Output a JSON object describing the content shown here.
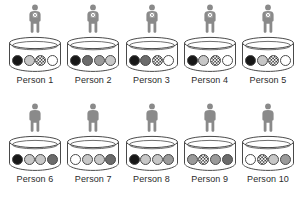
{
  "figure": {
    "title": "",
    "icon_name": "person-icon",
    "container_name": "urn-cylinder",
    "colors": {
      "black": "#171717",
      "dark_gray": "#6b6b6b",
      "gray": "#9a9a9a",
      "light_gray": "#c7c7c7",
      "white": "#ffffff",
      "checkered": "#3a3a3a",
      "outline": "#4a4a4a",
      "person_fill": "#8a8a8a",
      "label_text": "#2b2b2b",
      "background": "#ffffff"
    },
    "rows": [
      {
        "row_name": "top-row",
        "person_marked": true,
        "cells": [
          {
            "label": "Person 1",
            "balls": [
              "black",
              "light_gray",
              "checkered",
              "white"
            ]
          },
          {
            "label": "Person 2",
            "balls": [
              "black",
              "dark_gray",
              "gray",
              "light_gray"
            ]
          },
          {
            "label": "Person 3",
            "balls": [
              "black",
              "dark_gray",
              "checkered",
              "white"
            ]
          },
          {
            "label": "Person 4",
            "balls": [
              "black",
              "light_gray",
              "checkered",
              "white"
            ]
          },
          {
            "label": "Person 5",
            "balls": [
              "black",
              "light_gray",
              "checkered",
              "white"
            ]
          }
        ]
      },
      {
        "row_name": "bottom-row",
        "person_marked": false,
        "cells": [
          {
            "label": "Person 6",
            "balls": [
              "black",
              "light_gray",
              "light_gray",
              "dark_gray"
            ]
          },
          {
            "label": "Person 7",
            "balls": [
              "white",
              "light_gray",
              "light_gray",
              "dark_gray"
            ]
          },
          {
            "label": "Person 8",
            "balls": [
              "black",
              "light_gray",
              "light_gray",
              "gray"
            ]
          },
          {
            "label": "Person 9",
            "balls": [
              "gray",
              "checkered",
              "gray",
              "dark_gray"
            ]
          },
          {
            "label": "Person 10",
            "balls": [
              "white",
              "checkered",
              "light_gray",
              "gray"
            ]
          }
        ]
      }
    ]
  }
}
